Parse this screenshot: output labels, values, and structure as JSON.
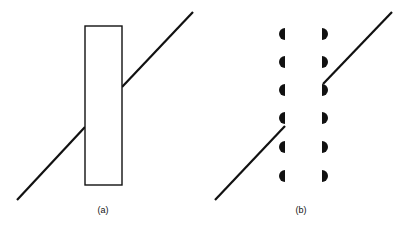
{
  "panels": [
    {
      "id": "a",
      "label": "(a)",
      "description": "Straight line passing behind a solid rectangular barrier",
      "rect": {
        "x": 85,
        "y": 26,
        "w": 37,
        "h": 159
      },
      "line_segments": [
        {
          "x1": 17,
          "y1": 200,
          "x2": 85,
          "y2": 127
        },
        {
          "x1": 122,
          "y1": 87,
          "x2": 193,
          "y2": 12
        }
      ],
      "label_pos": {
        "x": 103,
        "y": 205
      }
    },
    {
      "id": "b",
      "label": "(b)",
      "description": "Straight line passing between two columns of half-circle markers",
      "left_column_x": 285,
      "right_column_x": 322,
      "marker_rows_y": [
        34,
        62,
        90,
        118,
        147,
        176
      ],
      "marker_radius": 6,
      "line_segments": [
        {
          "x1": 215,
          "y1": 200,
          "x2": 285,
          "y2": 126
        },
        {
          "x1": 323,
          "y1": 84,
          "x2": 392,
          "y2": 12
        }
      ],
      "label_pos": {
        "x": 301,
        "y": 205
      }
    }
  ],
  "colors": {
    "stroke": "#111111",
    "background": "#ffffff"
  }
}
